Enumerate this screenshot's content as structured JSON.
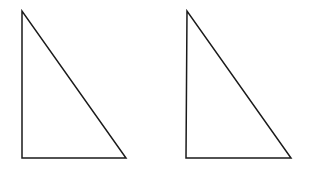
{
  "diagram": {
    "width": 310,
    "height": 170,
    "background": "#ffffff",
    "stroke_color": "#1a1a1a",
    "stroke_width": 1.5,
    "shapes": [
      {
        "type": "right-triangle",
        "name": "triangle-left",
        "points": [
          [
            22,
            11
          ],
          [
            22,
            158
          ],
          [
            126,
            158
          ]
        ]
      },
      {
        "type": "right-triangle",
        "name": "triangle-right",
        "points": [
          [
            187,
            11
          ],
          [
            186,
            158
          ],
          [
            291,
            158
          ]
        ]
      }
    ]
  }
}
